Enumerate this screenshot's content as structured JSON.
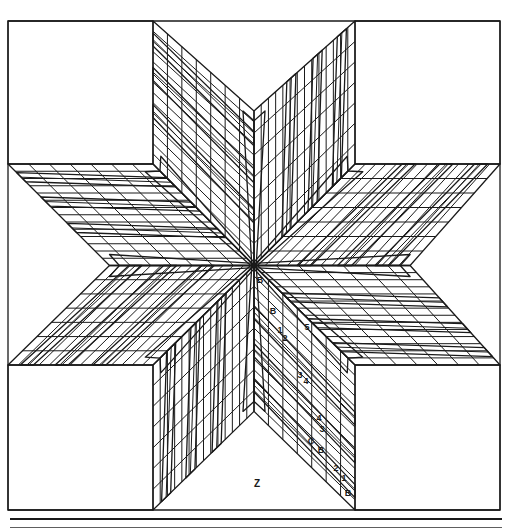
{
  "diagram": {
    "background": "#ffffff",
    "line_color": "#1a1a1a",
    "frame": {
      "x": 8,
      "y": 21,
      "w": 492,
      "h": 489
    },
    "center": {
      "x": 254,
      "y": 265.5
    },
    "corner_square_size": 145,
    "center_strip_half_width": 11,
    "region_label": "Z",
    "piece_labels": [
      {
        "text": "B",
        "x": 260,
        "y": 283
      },
      {
        "text": "B",
        "x": 273,
        "y": 314
      },
      {
        "text": "5",
        "x": 307,
        "y": 330
      },
      {
        "text": "1",
        "x": 280,
        "y": 333
      },
      {
        "text": "2",
        "x": 285,
        "y": 341
      },
      {
        "text": "3",
        "x": 300,
        "y": 378
      },
      {
        "text": "4",
        "x": 306,
        "y": 384
      },
      {
        "text": "4",
        "x": 319,
        "y": 421
      },
      {
        "text": "3",
        "x": 322,
        "y": 432
      },
      {
        "text": "C",
        "x": 311,
        "y": 444
      },
      {
        "text": "B",
        "x": 321,
        "y": 453
      },
      {
        "text": "2",
        "x": 336,
        "y": 471
      },
      {
        "text": "1",
        "x": 344,
        "y": 481
      },
      {
        "text": "B",
        "x": 348,
        "y": 496
      }
    ],
    "z_label_pos": {
      "x": 257,
      "y": 487
    },
    "bottom_rules": [
      {
        "y": 518,
        "h": 2
      },
      {
        "y": 527,
        "h": 1
      }
    ]
  }
}
